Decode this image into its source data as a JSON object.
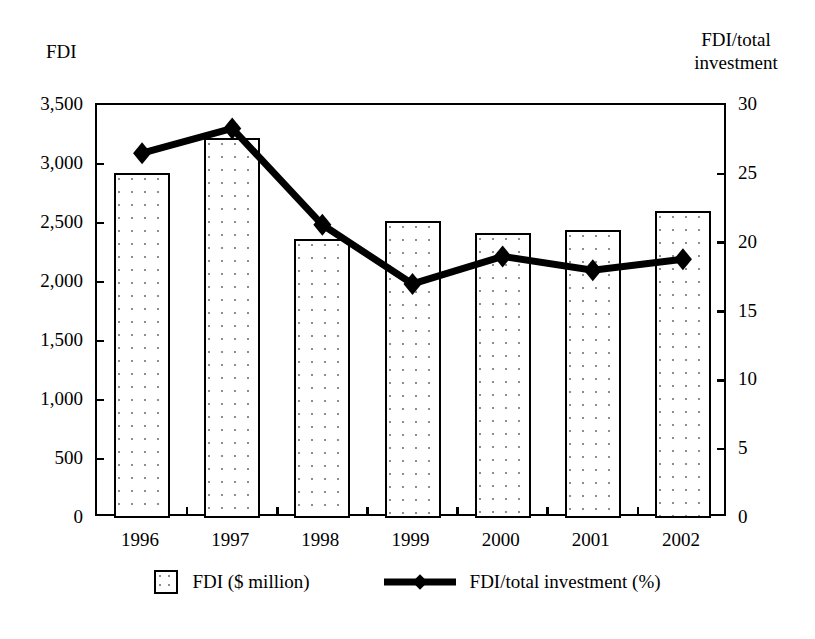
{
  "chart_data": {
    "type": "bar",
    "title": "",
    "subtitle": "",
    "xlabel": "",
    "ylabel": "FDI",
    "y2label": "FDI/total investment",
    "categories": [
      "1996",
      "1997",
      "1998",
      "1999",
      "2000",
      "2001",
      "2002"
    ],
    "series": [
      {
        "name": "FDI ($ million)",
        "type": "bar",
        "axis": "left",
        "values": [
          2920,
          3220,
          2365,
          2520,
          2415,
          2440,
          2600
        ]
      },
      {
        "name": "FDI/total investment (%)",
        "type": "line",
        "axis": "right",
        "values": [
          26.5,
          28.3,
          21.3,
          17.0,
          19.0,
          18.0,
          18.8
        ]
      }
    ],
    "ylim": [
      0,
      3500
    ],
    "y2lim": [
      0,
      30
    ],
    "yticks": [
      "0",
      "500",
      "1,000",
      "1,500",
      "2,000",
      "2,500",
      "3,000",
      "3,500"
    ],
    "ytick_values": [
      0,
      500,
      1000,
      1500,
      2000,
      2500,
      3000,
      3500
    ],
    "y2ticks": [
      "0",
      "5",
      "10",
      "15",
      "20",
      "25",
      "30"
    ],
    "y2tick_values": [
      0,
      5,
      10,
      15,
      20,
      25,
      30
    ],
    "grid": false,
    "legend_position": "bottom",
    "colors": {
      "bar_outline": "#000000",
      "bar_fill": "#ffffff",
      "bar_pattern": "#8d8d8d",
      "line": "#000000",
      "axis": "#000000",
      "background": "#ffffff"
    }
  },
  "axes": {
    "left_title": "FDI",
    "right_title": "FDI/total\ninvestment"
  },
  "legend": {
    "items": [
      {
        "label": "FDI ($ million)",
        "swatch": "dotted-square-swatch"
      },
      {
        "label": "FDI/total investment (%)",
        "swatch": "line-diamond-swatch"
      }
    ]
  }
}
